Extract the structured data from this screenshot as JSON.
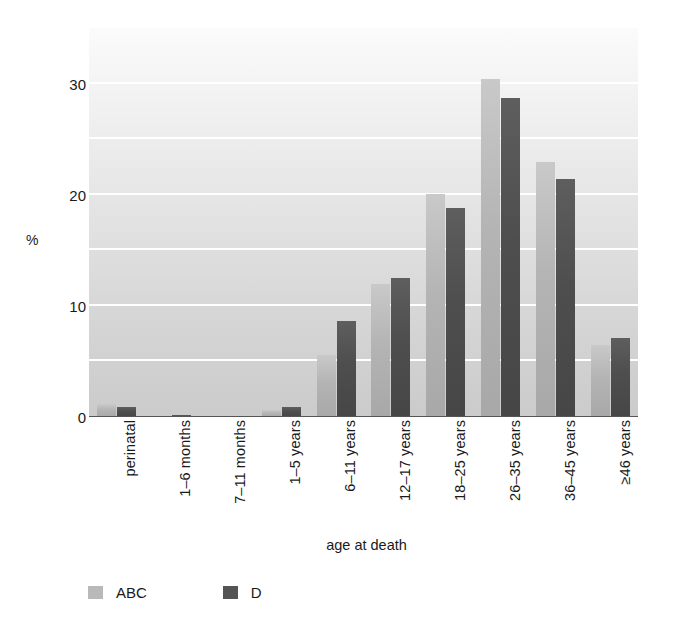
{
  "chart_data": {
    "type": "bar",
    "title": "",
    "subtitle": "",
    "xlabel": "age at death",
    "ylabel": "%",
    "ylim": [
      0,
      35
    ],
    "yticks": [
      0,
      10,
      20,
      30
    ],
    "ytick_labels": [
      "0",
      "10",
      "20",
      "30"
    ],
    "gridlines": [
      5,
      10,
      15,
      20,
      25,
      30,
      35
    ],
    "grid": true,
    "legend_position": "bottom-left",
    "categories": [
      "perinatal",
      "1–6 months",
      "7–11 months",
      "1–5 years",
      "6–11 years",
      "12–17 years",
      "18–25 years",
      "26–35 years",
      "36–45 years",
      "≥46 years"
    ],
    "series": [
      {
        "name": "ABC",
        "color": "#b9b9b9",
        "values": [
          1.2,
          0.0,
          0.0,
          0.6,
          5.6,
          12.0,
          20.1,
          30.4,
          22.9,
          6.5
        ]
      },
      {
        "name": "D",
        "color": "#545454",
        "values": [
          0.9,
          0.2,
          0.0,
          0.9,
          8.6,
          12.5,
          18.8,
          28.7,
          21.4,
          7.1
        ]
      }
    ]
  },
  "legend": {
    "items": [
      {
        "label": "ABC",
        "key": "abc"
      },
      {
        "label": "D",
        "key": "d"
      }
    ]
  }
}
